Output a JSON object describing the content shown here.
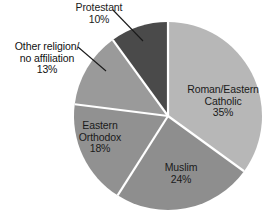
{
  "chart_data": {
    "type": "pie",
    "title": "",
    "subtitle": "",
    "xlabel": "",
    "ylabel": "",
    "legend_position": "none",
    "grid": false,
    "units": "percent",
    "total": 100,
    "start_angle_deg": 0,
    "direction": "clockwise",
    "categories": [
      "Roman/Eastern Catholic",
      "Muslim",
      "Eastern Orthodox",
      "Other religion/ no affiliation",
      "Protestant"
    ],
    "values": [
      35,
      24,
      18,
      13,
      10
    ],
    "slices": [
      {
        "key": "catholic",
        "label": "Roman/Eastern\nCatholic",
        "value_label": "35%",
        "value": 35,
        "color": "#b7b7b7",
        "label_placement": "inside",
        "leader_line": false
      },
      {
        "key": "muslim",
        "label": "Muslim",
        "value_label": "24%",
        "value": 24,
        "color": "#8e8e8e",
        "label_placement": "inside",
        "leader_line": false
      },
      {
        "key": "orthodox",
        "label": "Eastern\nOrthodox",
        "value_label": "18%",
        "value": 18,
        "color": "#919191",
        "label_placement": "inside",
        "leader_line": false
      },
      {
        "key": "other",
        "label": "Other religion/\nno affiliation",
        "value_label": "13%",
        "value": 13,
        "color": "#9a9a9a",
        "label_placement": "outside",
        "leader_line": true
      },
      {
        "key": "protestant",
        "label": "Protestant",
        "value_label": "10%",
        "value": 10,
        "color": "#4a4a4a",
        "label_placement": "outside",
        "leader_line": true
      }
    ],
    "geometry": {
      "center_x": 168,
      "center_y": 116,
      "radius": 94,
      "separator_color": "#ffffff",
      "separator_width": 2.2,
      "background": "#ffffff"
    }
  },
  "labels": {
    "catholic": {
      "text": "Roman/Eastern\nCatholic\n35%"
    },
    "muslim": {
      "text": "Muslim\n24%"
    },
    "orthodox": {
      "text": "Eastern\nOrthodox\n18%"
    },
    "other": {
      "text": "Other religion/\nno affiliation\n13%"
    },
    "protestant": {
      "text": "Protestant\n10%"
    }
  }
}
